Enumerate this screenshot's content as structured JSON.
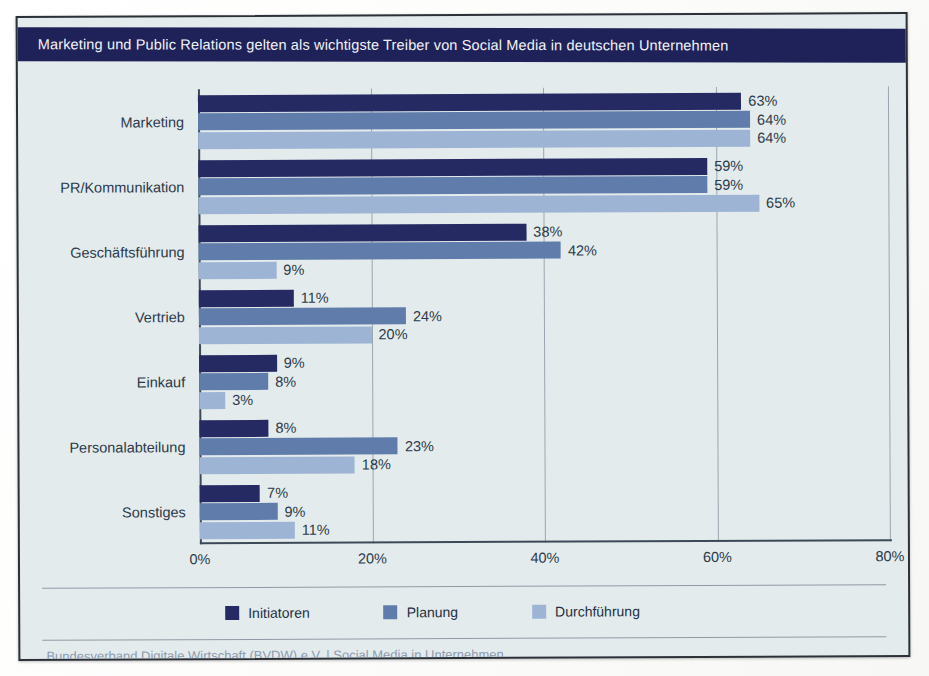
{
  "header": {
    "title": "Marketing und Public Relations gelten als wichtigste Treiber von Social Media in deutschen Unternehmen"
  },
  "footer": {
    "source": "Bundesverband Digitale Wirtschaft (BVDW) e.V. | Social Media in Unternehmen"
  },
  "colors": {
    "header_bar": "#1f2259",
    "panel_bg": "#e4ebed",
    "series_1": "#262a63",
    "series_2": "#5f7cab",
    "series_3": "#9db4d4",
    "axis": "#3c4a57",
    "grid": "#9aa7b0",
    "text": "#2b3a4a",
    "source_text": "#8d9bb0"
  },
  "chart_data": {
    "type": "bar",
    "orientation": "horizontal",
    "title": "Marketing und Public Relations gelten als wichtigste Treiber von Social Media in deutschen Unternehmen",
    "xlabel": "",
    "ylabel": "",
    "xlim": [
      0,
      80
    ],
    "xticks": [
      "0%",
      "20%",
      "40%",
      "60%",
      "80%"
    ],
    "xtick_values": [
      0,
      20,
      40,
      60,
      80
    ],
    "grid": true,
    "legend_position": "bottom",
    "categories": [
      "Marketing",
      "PR/Kommunikation",
      "Geschäftsführung",
      "Vertrieb",
      "Einkauf",
      "Personalabteilung",
      "Sonstiges"
    ],
    "series": [
      {
        "name": "Initiatoren",
        "color": "#262a63",
        "values": [
          63,
          59,
          38,
          11,
          9,
          8,
          7
        ],
        "labels": [
          "63%",
          "59%",
          "38%",
          "11%",
          "9%",
          "8%",
          "7%"
        ]
      },
      {
        "name": "Planung",
        "color": "#5f7cab",
        "values": [
          64,
          59,
          42,
          24,
          8,
          23,
          9
        ],
        "labels": [
          "64%",
          "59%",
          "42%",
          "24%",
          "8%",
          "23%",
          "9%"
        ]
      },
      {
        "name": "Durchführung",
        "color": "#9db4d4",
        "values": [
          64,
          65,
          9,
          20,
          3,
          18,
          11
        ],
        "labels": [
          "64%",
          "65%",
          "9%",
          "20%",
          "3%",
          "18%",
          "11%"
        ]
      }
    ]
  }
}
